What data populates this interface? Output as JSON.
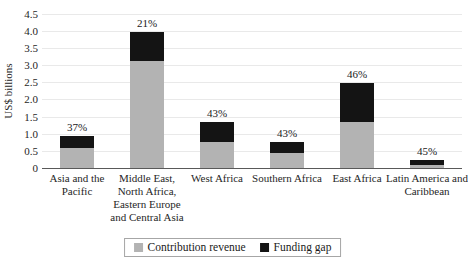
{
  "chart_data": {
    "type": "bar",
    "stacked": true,
    "title": "",
    "ylabel": "US$ billions",
    "xlabel": "",
    "ylim": [
      0,
      4.5
    ],
    "grid": true,
    "legend_position": "bottom",
    "yticks": [
      {
        "value": 0,
        "label": "0"
      },
      {
        "value": 0.5,
        "label": "0.5"
      },
      {
        "value": 1.0,
        "label": "1.0"
      },
      {
        "value": 1.5,
        "label": "1.5"
      },
      {
        "value": 2.0,
        "label": "2.0"
      },
      {
        "value": 2.5,
        "label": "2.5"
      },
      {
        "value": 3.0,
        "label": "3.0"
      },
      {
        "value": 3.5,
        "label": "3.5"
      },
      {
        "value": 4.0,
        "label": "4.0"
      },
      {
        "value": 4.5,
        "label": "4.5"
      }
    ],
    "categories": [
      "Asia and the Pacific",
      "Middle East, North Africa, Eastern Europe and Central Asia",
      "West Africa",
      "Southern Africa",
      "East Africa",
      "Latin America and Caribbean"
    ],
    "series": [
      {
        "name": "Contribution revenue",
        "color": "#b3b3b3",
        "values": [
          0.57,
          3.12,
          0.76,
          0.44,
          1.34,
          0.1
        ]
      },
      {
        "name": "Funding gap",
        "color": "#141414",
        "values": [
          0.35,
          0.84,
          0.57,
          0.33,
          1.14,
          0.14
        ]
      }
    ],
    "bar_labels": [
      "37%",
      "21%",
      "43%",
      "43%",
      "46%",
      "45%"
    ]
  },
  "colors": {
    "gridline": "#e9e9e9",
    "axis": "#595959",
    "text": "#262626",
    "legend_border": "#a6a6a6"
  }
}
